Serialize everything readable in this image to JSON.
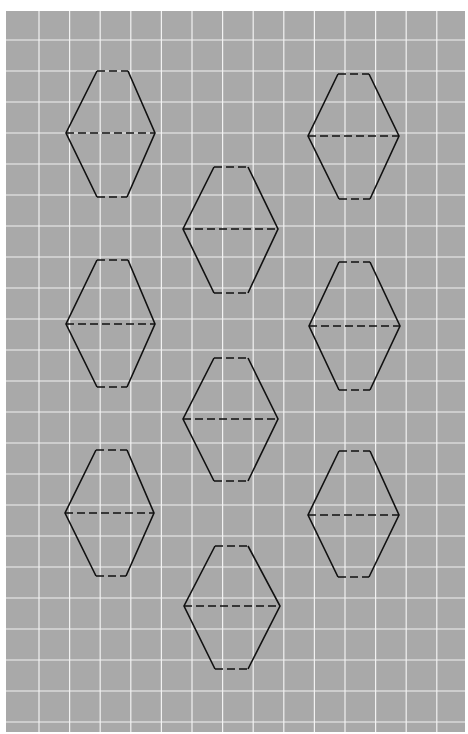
{
  "sheet": {
    "background": "#a9a9a9",
    "grid_color": "#f2f2f2",
    "line_color": "#111111",
    "grid": {
      "origin_x": 6,
      "origin_y": 11,
      "spacing_x": 30.6,
      "spacing_y": 31.0,
      "cols": 15,
      "rows": 23
    }
  },
  "hexagons": [
    {
      "id": "hex-left-1",
      "top": [
        97,
        71
      ],
      "top_w": 31,
      "mid": [
        66,
        133
      ],
      "mid_w": 89,
      "bottom": [
        97,
        197
      ],
      "bottom_w": 30
    },
    {
      "id": "hex-right-1",
      "top": [
        338,
        74
      ],
      "top_w": 31,
      "mid": [
        308,
        136
      ],
      "mid_w": 91,
      "bottom": [
        339,
        199
      ],
      "bottom_w": 31
    },
    {
      "id": "hex-center-1",
      "top": [
        214,
        167
      ],
      "top_w": 34,
      "mid": [
        183,
        229
      ],
      "mid_w": 95,
      "bottom": [
        214,
        293
      ],
      "bottom_w": 34
    },
    {
      "id": "hex-left-2",
      "top": [
        97,
        260
      ],
      "top_w": 31,
      "mid": [
        66,
        324
      ],
      "mid_w": 89,
      "bottom": [
        97,
        387
      ],
      "bottom_w": 30
    },
    {
      "id": "hex-right-2",
      "top": [
        339,
        262
      ],
      "top_w": 31,
      "mid": [
        309,
        326
      ],
      "mid_w": 91,
      "bottom": [
        339,
        390
      ],
      "bottom_w": 31
    },
    {
      "id": "hex-center-2",
      "top": [
        214,
        358
      ],
      "top_w": 34,
      "mid": [
        183,
        419
      ],
      "mid_w": 95,
      "bottom": [
        214,
        481
      ],
      "bottom_w": 34
    },
    {
      "id": "hex-left-3",
      "top": [
        96,
        450
      ],
      "top_w": 31,
      "mid": [
        65,
        513
      ],
      "mid_w": 89,
      "bottom": [
        96,
        576
      ],
      "bottom_w": 30
    },
    {
      "id": "hex-right-3",
      "top": [
        339,
        451
      ],
      "top_w": 31,
      "mid": [
        308,
        515
      ],
      "mid_w": 91,
      "bottom": [
        338,
        577
      ],
      "bottom_w": 31
    },
    {
      "id": "hex-center-3",
      "top": [
        215,
        546
      ],
      "top_w": 33,
      "mid": [
        184,
        606
      ],
      "mid_w": 96,
      "bottom": [
        215,
        669
      ],
      "bottom_w": 33
    }
  ]
}
